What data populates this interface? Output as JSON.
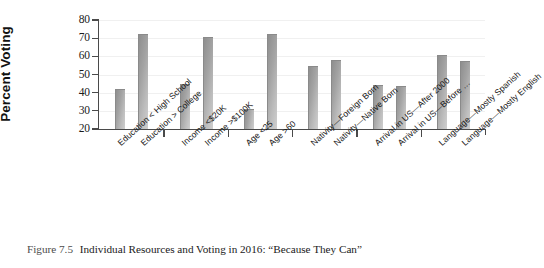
{
  "figure": {
    "caption_label": "Figure 7.5",
    "caption_title": "Individual Resources and Voting in 2016: “Because They Can”"
  },
  "chart_data": {
    "type": "bar",
    "title": "",
    "xlabel": "",
    "ylabel": "Percent Voting",
    "ylim": [
      20,
      80
    ],
    "yticks": [
      20,
      30,
      40,
      50,
      60,
      70,
      80
    ],
    "grid": true,
    "legend": "none",
    "bar_color": "#a3a3a3",
    "categories": [
      "Education < High School",
      "Education > College",
      "Income <$20K",
      "Income >$100K",
      "Age <25",
      "Age >60",
      "Nativity—Foreign Born",
      "Nativity—Native Born",
      "Arrival in US—After 2000",
      "Arrival in US—Before …",
      "Language—Mostly Spanish",
      "Language—Mostly English"
    ],
    "values": [
      41.5,
      71.5,
      44.0,
      70.0,
      30.5,
      72.0,
      54.0,
      57.5,
      43.5,
      43.0,
      60.0,
      57.0
    ],
    "groups": [
      {
        "name": "Education",
        "categories": [
          "Education < High School",
          "Education > College"
        ]
      },
      {
        "name": "Income",
        "categories": [
          "Income <$20K",
          "Income >$100K"
        ]
      },
      {
        "name": "Age",
        "categories": [
          "Age <25",
          "Age >60"
        ]
      },
      {
        "name": "Nativity",
        "categories": [
          "Nativity—Foreign Born",
          "Nativity—Native Born"
        ]
      },
      {
        "name": "Arrival in US",
        "categories": [
          "Arrival in US—After 2000",
          "Arrival in US—Before …"
        ]
      },
      {
        "name": "Language",
        "categories": [
          "Language—Mostly Spanish",
          "Language—Mostly English"
        ]
      }
    ]
  }
}
